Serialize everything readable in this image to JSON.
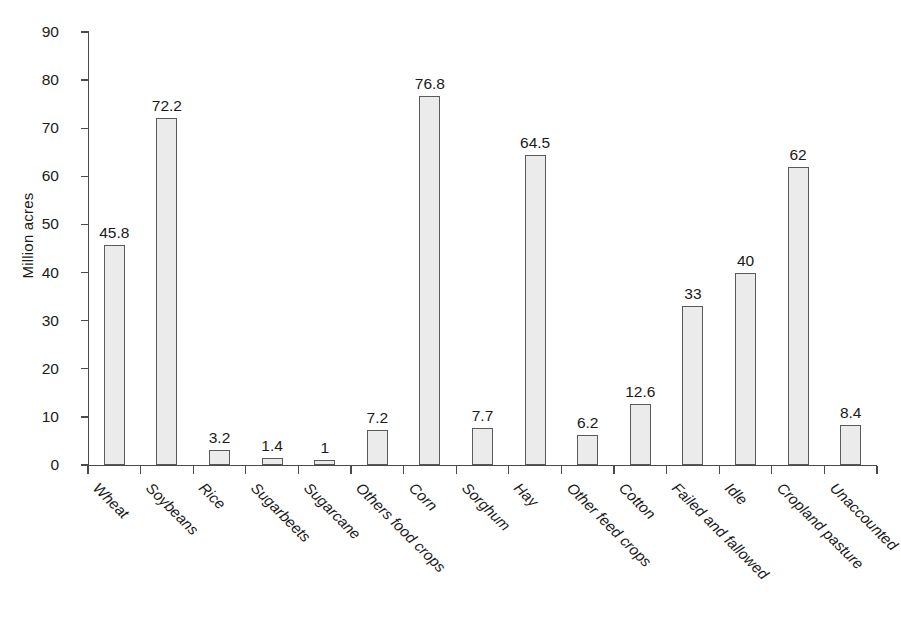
{
  "chart_data": {
    "type": "bar",
    "title": "",
    "subtitle": "",
    "xlabel": "",
    "ylabel": "Million acres",
    "ylim": [
      0,
      90
    ],
    "ytick_step": 10,
    "yticks": [
      90,
      80,
      70,
      60,
      50,
      40,
      30,
      20,
      10,
      0
    ],
    "grid": false,
    "legend": "none",
    "categories": [
      "Wheat",
      "Soybeans",
      "Rice",
      "Sugarbeets",
      "Sugarcane",
      "Others food crops",
      "Corn",
      "Sorghum",
      "Hay",
      "Other feed crops",
      "Cotton",
      "Failed and fallowed",
      "Idle",
      "Cropland pasture",
      "Unaccounted"
    ],
    "values": [
      45.8,
      72.2,
      3.2,
      1.4,
      1,
      7.2,
      76.8,
      7.7,
      64.5,
      6.2,
      12.6,
      33,
      40,
      62,
      8.4
    ],
    "value_labels": [
      "45.8",
      "72.2",
      "3.2",
      "1.4",
      "1",
      "7.2",
      "76.8",
      "7.7",
      "64.5",
      "6.2",
      "12.6",
      "33",
      "40",
      "62",
      "8.4"
    ],
    "bar_fill_color": "#ebebeb",
    "bar_border_color": "#5a5a5a",
    "axis_color": "#4a4a4a",
    "text_color": "#1a1a1a",
    "background_color": "#ffffff"
  }
}
